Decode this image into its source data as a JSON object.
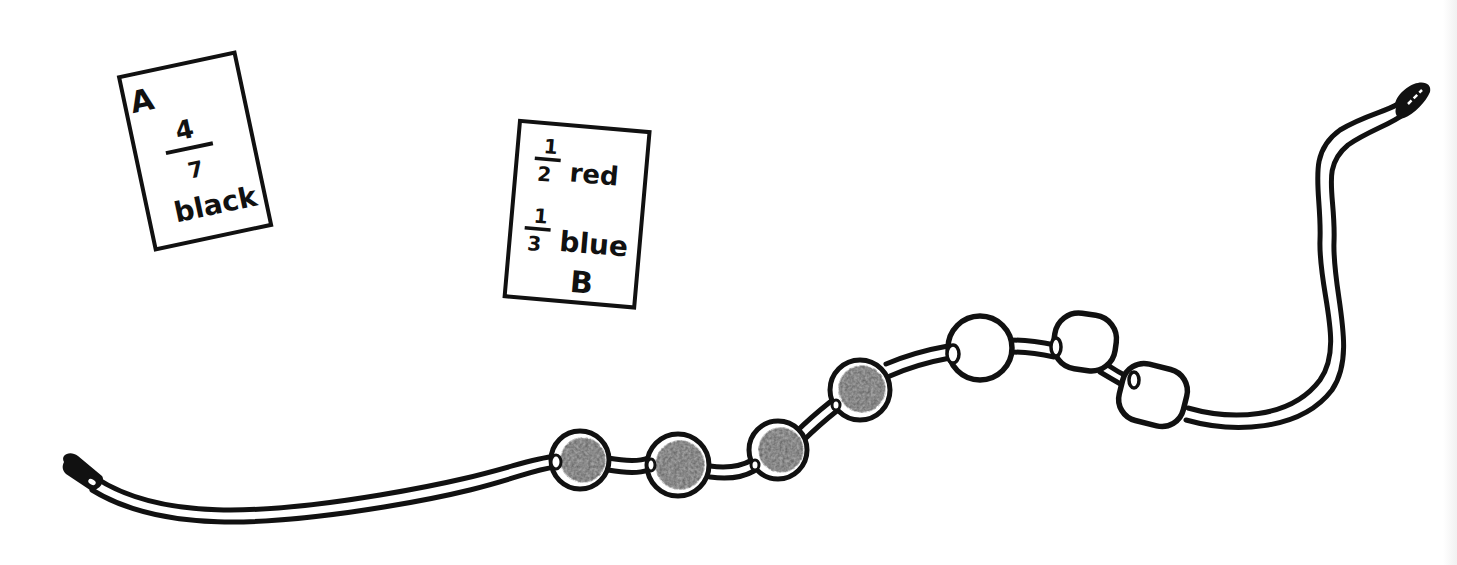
{
  "colors": {
    "ink": "#111111",
    "paper": "#ffffff",
    "shaded_bead": "#3a3a3a",
    "shaded_bead_mottle": "#8a8a8a",
    "plain_bead": "#ffffff"
  },
  "card_a": {
    "label": "A",
    "numerator": "4",
    "denominator": "7",
    "color_word": "black"
  },
  "card_b": {
    "label": "B",
    "rows": [
      {
        "numerator": "1",
        "denominator": "2",
        "color_word": "red"
      },
      {
        "numerator": "1",
        "denominator": "3",
        "color_word": "blue"
      }
    ]
  },
  "string": {
    "bead_count": 7,
    "beads": [
      {
        "index": 1,
        "style": "shaded"
      },
      {
        "index": 2,
        "style": "shaded"
      },
      {
        "index": 3,
        "style": "shaded"
      },
      {
        "index": 4,
        "style": "shaded"
      },
      {
        "index": 5,
        "style": "plain"
      },
      {
        "index": 6,
        "style": "plain"
      },
      {
        "index": 7,
        "style": "plain"
      }
    ],
    "shaded_count": 4,
    "plain_count": 3
  }
}
